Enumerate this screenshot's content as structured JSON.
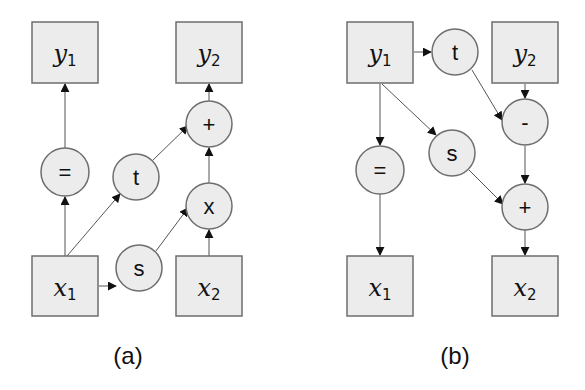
{
  "panels": [
    {
      "caption": "(a)",
      "boxes": [
        {
          "id": "y1",
          "base": "y",
          "sub": "1",
          "x": 32,
          "y": 22
        },
        {
          "id": "y2",
          "base": "y",
          "sub": "2",
          "x": 176,
          "y": 22
        },
        {
          "id": "x1",
          "base": "x",
          "sub": "1",
          "x": 32,
          "y": 256
        },
        {
          "id": "x2",
          "base": "x",
          "sub": "2",
          "x": 176,
          "y": 256
        }
      ],
      "nodes": [
        {
          "id": "eq",
          "label": "=",
          "cx": 65,
          "cy": 172
        },
        {
          "id": "t",
          "label": "t",
          "cx": 136,
          "cy": 177
        },
        {
          "id": "plus",
          "label": "+",
          "cx": 209,
          "cy": 124
        },
        {
          "id": "times",
          "label": "x",
          "cx": 209,
          "cy": 206
        },
        {
          "id": "s",
          "label": "s",
          "cx": 139,
          "cy": 268
        }
      ],
      "edges": [
        [
          "x1",
          "eq"
        ],
        [
          "eq",
          "y1"
        ],
        [
          "x1",
          "t"
        ],
        [
          "t",
          "plus"
        ],
        [
          "x1",
          "s"
        ],
        [
          "s",
          "times"
        ],
        [
          "x2",
          "times"
        ],
        [
          "times",
          "plus"
        ],
        [
          "plus",
          "y2"
        ]
      ]
    },
    {
      "caption": "(b)",
      "boxes": [
        {
          "id": "y1",
          "base": "y",
          "sub": "1",
          "x": 347,
          "y": 22
        },
        {
          "id": "y2",
          "base": "y",
          "sub": "2",
          "x": 492,
          "y": 22
        },
        {
          "id": "x1",
          "base": "x",
          "sub": "1",
          "x": 347,
          "y": 256
        },
        {
          "id": "x2",
          "base": "x",
          "sub": "2",
          "x": 492,
          "y": 256
        }
      ],
      "nodes": [
        {
          "id": "t",
          "label": "t",
          "cx": 455,
          "cy": 52
        },
        {
          "id": "minus",
          "label": "-",
          "cx": 525,
          "cy": 122
        },
        {
          "id": "eq",
          "label": "=",
          "cx": 380,
          "cy": 170
        },
        {
          "id": "s",
          "label": "s",
          "cx": 452,
          "cy": 153
        },
        {
          "id": "plus",
          "label": "+",
          "cx": 525,
          "cy": 207
        }
      ],
      "edges": [
        [
          "y1",
          "t"
        ],
        [
          "y1",
          "eq"
        ],
        [
          "y1",
          "s"
        ],
        [
          "t",
          "minus"
        ],
        [
          "y2",
          "minus"
        ],
        [
          "minus",
          "plus"
        ],
        [
          "s",
          "plus"
        ],
        [
          "eq",
          "x1"
        ],
        [
          "plus",
          "x2"
        ]
      ]
    }
  ],
  "labels": {
    "a": {
      "y1": {
        "base": "y",
        "sub": "1"
      },
      "y2": {
        "base": "y",
        "sub": "2"
      },
      "x1": {
        "base": "x",
        "sub": "1"
      },
      "x2": {
        "base": "x",
        "sub": "2"
      },
      "eq": "=",
      "t": "t",
      "plus": "+",
      "times": "x",
      "s": "s",
      "caption": "(a)"
    },
    "b": {
      "y1": {
        "base": "y",
        "sub": "1"
      },
      "y2": {
        "base": "y",
        "sub": "2"
      },
      "x1": {
        "base": "x",
        "sub": "1"
      },
      "x2": {
        "base": "x",
        "sub": "2"
      },
      "t": "t",
      "minus": "-",
      "eq": "=",
      "s": "s",
      "plus": "+",
      "caption": "(b)"
    }
  },
  "colors": {
    "fill": "#ececec",
    "stroke": "#6e6e6e",
    "edge": "#555555",
    "text": "#111111"
  }
}
